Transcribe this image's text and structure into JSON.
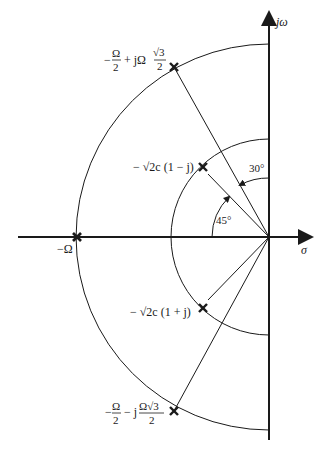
{
  "diagram": {
    "type": "s-plane pole plot",
    "axes": {
      "imag_label": "jω",
      "real_label": "σ"
    },
    "poles": [
      {
        "id": "p1",
        "label": "−Ω/2 + jΩ√3/2",
        "x": 174,
        "y": 67
      },
      {
        "id": "p2",
        "label": "−√2c (1 − j)",
        "x": 203,
        "y": 167
      },
      {
        "id": "p3",
        "label": "−Ω",
        "x": 77,
        "y": 237
      },
      {
        "id": "p4",
        "label": "−√2c (1 + j)",
        "x": 203,
        "y": 308
      },
      {
        "id": "p5",
        "label": "−Ω/2 − jΩ√3/2",
        "x": 174,
        "y": 411
      }
    ],
    "angles": [
      {
        "label": "30°"
      },
      {
        "label": "45°"
      }
    ],
    "colors": {
      "ink": "#1a1a1a",
      "background": "#ffffff"
    }
  },
  "labels": {
    "jw": "jω",
    "sigma": "σ",
    "neg_omega": "−Ω",
    "top_pole_a": "−",
    "top_pole_omega": "Ω",
    "top_pole_two": "2",
    "top_pole_plus": "+ jΩ",
    "top_pole_sqrt3": "√3",
    "top_pole_two2": "2",
    "mid_upper": "− √2c (1 − j)",
    "mid_lower": "− √2c (1 + j)",
    "bot_pole_a": "−",
    "bot_pole_omega": "Ω",
    "bot_pole_two": "2",
    "bot_pole_minus": "− j",
    "bot_pole_num": "Ω√3",
    "bot_pole_two2": "2",
    "angle_30": "30°",
    "angle_45": "45°"
  }
}
